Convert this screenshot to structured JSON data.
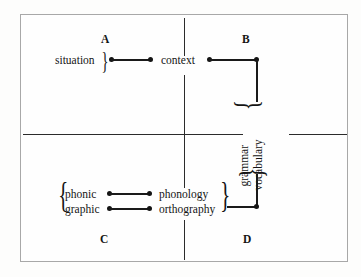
{
  "diagram": {
    "background_color": "#fdfdfc",
    "ink_color": "#141414",
    "frame_color": "#a8a8a8",
    "quadrant_labels": [
      {
        "id": "A",
        "text": "A",
        "quadrant": "top-left"
      },
      {
        "id": "B",
        "text": "B",
        "quadrant": "top-right"
      },
      {
        "id": "C",
        "text": "C",
        "quadrant": "bottom-left"
      },
      {
        "id": "D",
        "text": "D",
        "quadrant": "bottom-right"
      }
    ],
    "nodes": [
      {
        "id": "situation",
        "text": "situation",
        "quadrant": "A"
      },
      {
        "id": "context",
        "text": "context",
        "quadrant": "A"
      },
      {
        "id": "grammar",
        "text": "grammar",
        "quadrant": "B",
        "orientation": "vertical"
      },
      {
        "id": "vocabulary",
        "text": "vocabulary",
        "quadrant": "B",
        "orientation": "vertical"
      },
      {
        "id": "phonic",
        "text": "phonic",
        "quadrant": "C"
      },
      {
        "id": "graphic",
        "text": "graphic",
        "quadrant": "C"
      },
      {
        "id": "phonology",
        "text": "phonology",
        "quadrant": "C"
      },
      {
        "id": "orthography",
        "text": "orthography",
        "quadrant": "C"
      }
    ],
    "braces": {
      "situation_close": "}",
      "phonic_graphic_open": "{",
      "phonology_orthography_close": "}",
      "grammar_vocabulary_top": "}",
      "grammar_vocabulary_bottom": "}"
    },
    "axes": {
      "horizontal": "horizontal-axis",
      "vertical": "vertical-axis"
    },
    "connections": [
      {
        "from": "situation",
        "to": "context"
      },
      {
        "from": "context",
        "to": "grammar-vocabulary"
      },
      {
        "from": "grammar-vocabulary",
        "to": "phonology-orthography"
      },
      {
        "from": "phonic",
        "to": "phonology"
      },
      {
        "from": "graphic",
        "to": "orthography"
      }
    ]
  }
}
